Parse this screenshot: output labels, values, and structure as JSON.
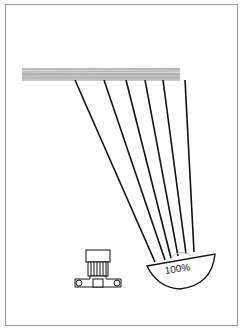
{
  "figure": {
    "type": "illumination diagram",
    "elements": [
      "ceiling-surface",
      "light-rays",
      "lamp-reflector",
      "light-meter"
    ],
    "reflector_label": "100%",
    "ray_count": 6,
    "colors": {
      "line": "#111111",
      "surface": "#a8a8a8",
      "frame": "#9a9a9a"
    }
  }
}
